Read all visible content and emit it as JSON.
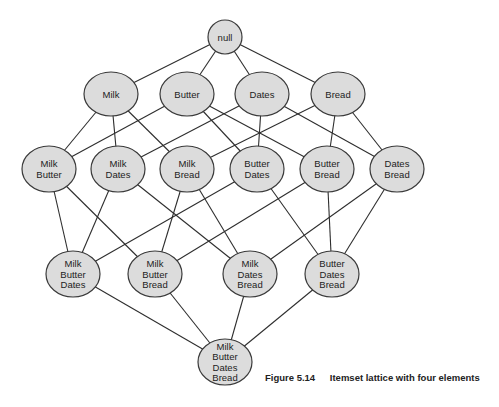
{
  "diagram": {
    "type": "itemset-lattice",
    "nodes": [
      {
        "id": "n0",
        "lines": [
          "null"
        ],
        "x": 225,
        "y": 37,
        "rx": 17,
        "ry": 17
      },
      {
        "id": "n1",
        "lines": [
          "Milk"
        ],
        "x": 111,
        "y": 94,
        "rx": 27,
        "ry": 22
      },
      {
        "id": "n2",
        "lines": [
          "Butter"
        ],
        "x": 187,
        "y": 94,
        "rx": 27,
        "ry": 22
      },
      {
        "id": "n3",
        "lines": [
          "Dates"
        ],
        "x": 262,
        "y": 94,
        "rx": 27,
        "ry": 22
      },
      {
        "id": "n4",
        "lines": [
          "Bread"
        ],
        "x": 338,
        "y": 94,
        "rx": 27,
        "ry": 22
      },
      {
        "id": "n5",
        "lines": [
          "Milk",
          "Butter"
        ],
        "x": 49,
        "y": 169,
        "rx": 27,
        "ry": 23
      },
      {
        "id": "n6",
        "lines": [
          "Milk",
          "Dates"
        ],
        "x": 118,
        "y": 169,
        "rx": 27,
        "ry": 23
      },
      {
        "id": "n7",
        "lines": [
          "Milk",
          "Bread"
        ],
        "x": 187,
        "y": 169,
        "rx": 27,
        "ry": 23
      },
      {
        "id": "n8",
        "lines": [
          "Butter",
          "Dates"
        ],
        "x": 257,
        "y": 169,
        "rx": 27,
        "ry": 23
      },
      {
        "id": "n9",
        "lines": [
          "Butter",
          "Bread"
        ],
        "x": 327,
        "y": 169,
        "rx": 27,
        "ry": 23
      },
      {
        "id": "n10",
        "lines": [
          "Dates",
          "Bread"
        ],
        "x": 397,
        "y": 169,
        "rx": 27,
        "ry": 23
      },
      {
        "id": "n11",
        "lines": [
          "Milk",
          "Butter",
          "Dates"
        ],
        "x": 73,
        "y": 274,
        "rx": 27,
        "ry": 23
      },
      {
        "id": "n12",
        "lines": [
          "Milk",
          "Butter",
          "Bread"
        ],
        "x": 155,
        "y": 274,
        "rx": 27,
        "ry": 23
      },
      {
        "id": "n13",
        "lines": [
          "Milk",
          "Dates",
          "Bread"
        ],
        "x": 250,
        "y": 274,
        "rx": 27,
        "ry": 23
      },
      {
        "id": "n14",
        "lines": [
          "Butter",
          "Dates",
          "Bread"
        ],
        "x": 332,
        "y": 274,
        "rx": 27,
        "ry": 23
      },
      {
        "id": "n15",
        "lines": [
          "Milk",
          "Butter",
          "Dates",
          "Bread"
        ],
        "x": 225,
        "y": 362,
        "rx": 27,
        "ry": 23
      }
    ],
    "edges": [
      [
        "n0",
        "n1"
      ],
      [
        "n0",
        "n2"
      ],
      [
        "n0",
        "n3"
      ],
      [
        "n0",
        "n4"
      ],
      [
        "n1",
        "n5"
      ],
      [
        "n1",
        "n6"
      ],
      [
        "n1",
        "n7"
      ],
      [
        "n2",
        "n5"
      ],
      [
        "n2",
        "n8"
      ],
      [
        "n2",
        "n9"
      ],
      [
        "n3",
        "n6"
      ],
      [
        "n3",
        "n8"
      ],
      [
        "n3",
        "n10"
      ],
      [
        "n4",
        "n7"
      ],
      [
        "n4",
        "n9"
      ],
      [
        "n4",
        "n10"
      ],
      [
        "n5",
        "n11"
      ],
      [
        "n5",
        "n12"
      ],
      [
        "n6",
        "n11"
      ],
      [
        "n6",
        "n13"
      ],
      [
        "n7",
        "n12"
      ],
      [
        "n7",
        "n13"
      ],
      [
        "n8",
        "n11"
      ],
      [
        "n8",
        "n14"
      ],
      [
        "n9",
        "n12"
      ],
      [
        "n9",
        "n14"
      ],
      [
        "n10",
        "n13"
      ],
      [
        "n10",
        "n14"
      ],
      [
        "n11",
        "n15"
      ],
      [
        "n12",
        "n15"
      ],
      [
        "n13",
        "n15"
      ],
      [
        "n14",
        "n15"
      ]
    ]
  },
  "caption": {
    "number": "Figure 5.14",
    "text": "Itemset lattice with four elements"
  }
}
